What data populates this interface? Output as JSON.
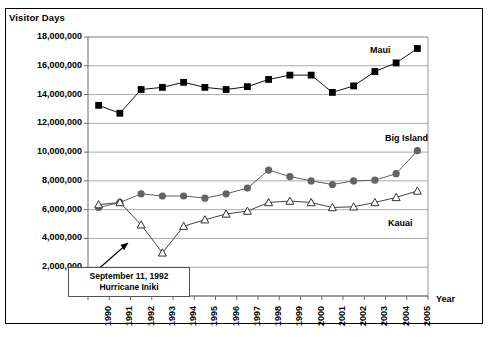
{
  "chart_data": {
    "type": "line",
    "title": "",
    "ylabel": "Visitor Days",
    "xlabel": "Year",
    "ylim": [
      0,
      18000000
    ],
    "yticks": [
      2000000,
      4000000,
      6000000,
      8000000,
      10000000,
      12000000,
      14000000,
      16000000,
      18000000
    ],
    "ytick_labels": [
      "2,000,000",
      "4,000,000",
      "6,000,000",
      "8,000,000",
      "10,000,000",
      "12,000,000",
      "14,000,000",
      "16,000,000",
      "18,000,000"
    ],
    "grid": true,
    "legend": "inline-labels",
    "categories": [
      1990,
      1991,
      1992,
      1993,
      1994,
      1995,
      1996,
      1997,
      1998,
      1999,
      2000,
      2001,
      2002,
      2003,
      2004,
      2005
    ],
    "xtick_labels": [
      "1990",
      "1991",
      "1992",
      "1993",
      "1994",
      "1995",
      "1996",
      "1997",
      "1998",
      "1999",
      "2000",
      "2001",
      "2002",
      "2003",
      "2004",
      "2005"
    ],
    "series": [
      {
        "name": "Maui",
        "marker": "filled-square",
        "color": "#000000",
        "values": [
          13250000,
          12700000,
          14350000,
          14500000,
          14850000,
          14500000,
          14350000,
          14550000,
          15050000,
          15350000,
          15350000,
          14150000,
          14600000,
          15600000,
          16200000,
          17200000
        ]
      },
      {
        "name": "Big Island",
        "marker": "filled-circle",
        "color": "#595959",
        "values": [
          6150000,
          6500000,
          7100000,
          6950000,
          6950000,
          6800000,
          7100000,
          7500000,
          8750000,
          8300000,
          8000000,
          7750000,
          8000000,
          8050000,
          8500000,
          10100000
        ]
      },
      {
        "name": "Kauai",
        "marker": "open-triangle",
        "color": "#404040",
        "values": [
          6350000,
          6500000,
          4950000,
          3000000,
          4850000,
          5300000,
          5700000,
          5900000,
          6500000,
          6600000,
          6500000,
          6150000,
          6200000,
          6500000,
          6850000,
          7300000
        ]
      }
    ],
    "annotations": [
      {
        "name": "hurricane-iniki",
        "line1": "September 11, 1992",
        "line2": "Hurricane Iniki",
        "points_to_year": 1992
      }
    ]
  },
  "series_labels": {
    "maui": "Maui",
    "big_island": "Big Island",
    "kauai": "Kauai"
  },
  "axis": {
    "y_title": "Visitor Days",
    "x_title": "Year"
  }
}
